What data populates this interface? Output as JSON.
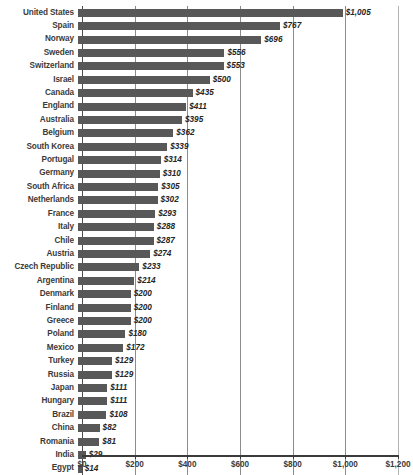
{
  "chart_data": {
    "type": "bar",
    "orientation": "horizontal",
    "title": "",
    "subtitle": "",
    "xlabel": "",
    "ylabel": "",
    "xlim": [
      0,
      1200
    ],
    "grid": true,
    "legend": null,
    "value_prefix": "$",
    "bar_color": "#585858",
    "categories": [
      "United States",
      "Spain",
      "Norway",
      "Sweden",
      "Switzerland",
      "Israel",
      "Canada",
      "England",
      "Australia",
      "Belgium",
      "South Korea",
      "Portugal",
      "Germany",
      "South Africa",
      "Netherlands",
      "France",
      "Italy",
      "Chile",
      "Austria",
      "Czech Republic",
      "Argentina",
      "Denmark",
      "Finland",
      "Greece",
      "Poland",
      "Mexico",
      "Turkey",
      "Russia",
      "Japan",
      "Hungary",
      "Brazil",
      "China",
      "Romania",
      "India",
      "Egypt"
    ],
    "values": [
      1005,
      767,
      696,
      556,
      553,
      500,
      435,
      411,
      395,
      362,
      339,
      314,
      310,
      305,
      302,
      293,
      288,
      287,
      274,
      233,
      214,
      200,
      200,
      200,
      180,
      172,
      129,
      129,
      111,
      111,
      108,
      82,
      81,
      29,
      14
    ],
    "value_labels": [
      "$1,005",
      "$767",
      "$696",
      "$556",
      "$553",
      "$500",
      "$435",
      "$411",
      "$395",
      "$362",
      "$339",
      "$314",
      "$310",
      "$305",
      "$302",
      "$293",
      "$288",
      "$287",
      "$274",
      "$233",
      "$214",
      "$200",
      "$200",
      "$200",
      "$180",
      "$172",
      "$129",
      "$129",
      "$111",
      "$111",
      "$108",
      "$82",
      "$81",
      "$29",
      "$14"
    ],
    "x_ticks": [
      0,
      200,
      400,
      600,
      800,
      1000,
      1200
    ],
    "x_tick_labels": [
      "$0",
      "$200",
      "$400",
      "$600",
      "$800",
      "$1,000",
      "$1,200"
    ]
  }
}
